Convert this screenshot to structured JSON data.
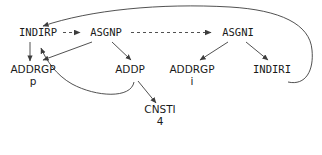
{
  "diagram": {
    "type": "dag",
    "title": "",
    "style": {
      "edge_color": "#3d3d3d",
      "text_color": "#1a1a1a",
      "background": "#ffffff",
      "dashed_pattern": "3 3"
    },
    "nodes": [
      {
        "id": "indirp",
        "op": "INDIRP",
        "sub": "",
        "x": 38,
        "y": 35,
        "mono": true
      },
      {
        "id": "asgnp",
        "op": "ASGNP",
        "sub": "",
        "x": 106,
        "y": 35,
        "mono": true
      },
      {
        "id": "asgni",
        "op": "ASGNI",
        "sub": "",
        "x": 238,
        "y": 35,
        "mono": true
      },
      {
        "id": "addrgp_p",
        "op": "ADDRGP",
        "sub": "p",
        "x": 33,
        "y": 72,
        "mono": false
      },
      {
        "id": "addp",
        "op": "ADDP",
        "sub": "",
        "x": 130,
        "y": 72,
        "mono": false
      },
      {
        "id": "addrgp_i",
        "op": "ADDRGP",
        "sub": "i",
        "x": 192,
        "y": 72,
        "mono": false
      },
      {
        "id": "indiri",
        "op": "INDIRI",
        "sub": "",
        "x": 272,
        "y": 72,
        "mono": true
      },
      {
        "id": "cnsti",
        "op": "CNSTI",
        "sub": "4",
        "x": 160,
        "y": 112,
        "mono": false
      }
    ],
    "edges": [
      {
        "from": "indirp",
        "to": "asgnp",
        "style": "dashed",
        "kind": "sequence"
      },
      {
        "from": "asgnp",
        "to": "asgni",
        "style": "dashed",
        "kind": "sequence"
      },
      {
        "from": "indirp",
        "to": "addrgp_p",
        "style": "solid",
        "kind": "child"
      },
      {
        "from": "asgnp",
        "to": "addrgp_p",
        "style": "solid",
        "kind": "child"
      },
      {
        "from": "asgnp",
        "to": "addp",
        "style": "solid",
        "kind": "child"
      },
      {
        "from": "addp",
        "to": "cnsti",
        "style": "solid",
        "kind": "child"
      },
      {
        "from": "addp",
        "to": "indirp",
        "style": "solid",
        "kind": "back-edge-curved"
      },
      {
        "from": "asgni",
        "to": "addrgp_i",
        "style": "solid",
        "kind": "child"
      },
      {
        "from": "asgni",
        "to": "indiri",
        "style": "solid",
        "kind": "child"
      },
      {
        "from": "indiri",
        "to": "indirp",
        "style": "solid",
        "kind": "back-edge-long-curved"
      }
    ]
  },
  "caption": {
    "text": ""
  }
}
